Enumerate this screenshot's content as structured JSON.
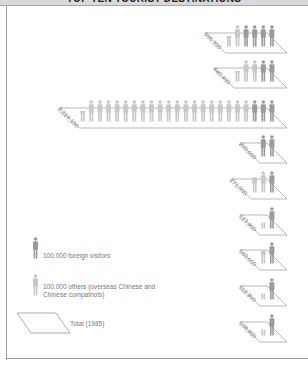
{
  "header": {
    "title": "TOP TEN TOURIST DESTINATIONS"
  },
  "colors": {
    "foreign": "#9b9b9b",
    "others": "#c8c8c8",
    "line": "#8a8a8a",
    "header_bg": "#d9d9d9"
  },
  "legend": {
    "foreign_label": "100,000 foreign visitors",
    "others_label": "100,000 others (overseas Chinese and Chinese compatriots)",
    "total_label": "Total (1985)"
  },
  "chart_data": {
    "type": "pictogram",
    "title": "TOP TEN TOURIST DESTINATIONS",
    "unit": "1 figure = 100,000 visitors",
    "year": 1985,
    "series": [
      {
        "name": "Foreign visitors",
        "color": "#9b9b9b"
      },
      {
        "name": "Others (overseas Chinese and Chinese compatriots)",
        "color": "#c8c8c8"
      }
    ],
    "categories": [
      "Beijing",
      "Shanghai",
      "Guangzhou (Canton)",
      "Guilin",
      "Zhuhai",
      "Xi'an",
      "Hangzhou",
      "Nanjing",
      "Suzhou"
    ],
    "destinations": [
      {
        "city": "Beijing",
        "total": "606,300",
        "total_value": 606300,
        "foreign_figs": 4,
        "others_figs": 1.5
      },
      {
        "city": "Shanghai",
        "total": "440,400",
        "total_value": 440400,
        "foreign_figs": 2,
        "others_figs": 2.5
      },
      {
        "city": "Guangzhou (Canton)",
        "total": "2,224,100",
        "total_value": 2224100,
        "foreign_figs": 3,
        "others_figs": 19.5
      },
      {
        "city": "Guilin",
        "total": "200,600",
        "total_value": 200600,
        "foreign_figs": 2,
        "others_figs": 0
      },
      {
        "city": "Zhuhai",
        "total": "271,000",
        "total_value": 271000,
        "foreign_figs": 1,
        "others_figs": 1.7
      },
      {
        "city": "Xi'an",
        "total": "123,900",
        "total_value": 123900,
        "foreign_figs": 1,
        "others_figs": 0.2
      },
      {
        "city": "Hangzhou",
        "total": "160,600",
        "total_value": 160600,
        "foreign_figs": 1,
        "others_figs": 0.6
      },
      {
        "city": "Nanjing",
        "total": "112,900",
        "total_value": 112900,
        "foreign_figs": 1,
        "others_figs": 0.1
      },
      {
        "city": "Suzhou",
        "total": "108,900",
        "total_value": 108900,
        "foreign_figs": 1,
        "others_figs": 0.1
      }
    ]
  }
}
